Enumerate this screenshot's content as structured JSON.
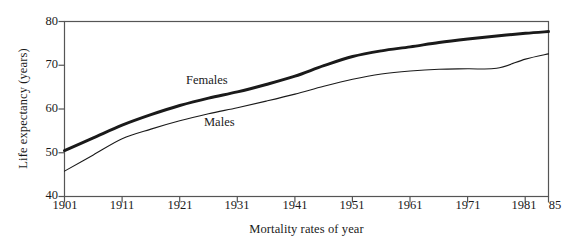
{
  "chart_data": {
    "type": "line",
    "title": "",
    "xlabel": "Mortality rates of year",
    "ylabel": "Life expectancy (years)",
    "xlim": [
      1901,
      1985
    ],
    "ylim": [
      40,
      80
    ],
    "xticks": [
      "1901",
      "1911",
      "1921",
      "1931",
      "1941",
      "1951",
      "1961",
      "1971",
      "1981",
      "85"
    ],
    "xtick_values": [
      1901,
      1911,
      1921,
      1931,
      1941,
      1951,
      1961,
      1971,
      1981,
      1985
    ],
    "yticks": [
      "40",
      "50",
      "60",
      "70",
      "80"
    ],
    "ytick_values": [
      40,
      50,
      60,
      70,
      80
    ],
    "grid": false,
    "legend_position": "inline-annotation",
    "x": [
      1901,
      1906,
      1911,
      1916,
      1921,
      1926,
      1931,
      1936,
      1941,
      1946,
      1951,
      1956,
      1961,
      1966,
      1971,
      1976,
      1981,
      1985
    ],
    "series": [
      {
        "name": "Females",
        "annotation": "Females",
        "line_weight": "bold",
        "color": "#1a1a1a",
        "values": [
          50.5,
          53.4,
          56.3,
          58.7,
          60.8,
          62.5,
          63.9,
          65.6,
          67.5,
          69.9,
          72.0,
          73.3,
          74.2,
          75.2,
          76.0,
          76.7,
          77.3,
          77.7
        ]
      },
      {
        "name": "Males",
        "annotation": "Males",
        "line_weight": "thin",
        "color": "#1a1a1a",
        "values": [
          45.8,
          49.5,
          53.2,
          55.4,
          57.3,
          58.9,
          60.3,
          61.8,
          63.4,
          65.2,
          66.8,
          68.0,
          68.7,
          69.1,
          69.2,
          69.3,
          71.4,
          72.6
        ]
      }
    ]
  },
  "axes": {
    "frame_color": "#555555",
    "tick_color": "#555555",
    "background": "#ffffff"
  }
}
